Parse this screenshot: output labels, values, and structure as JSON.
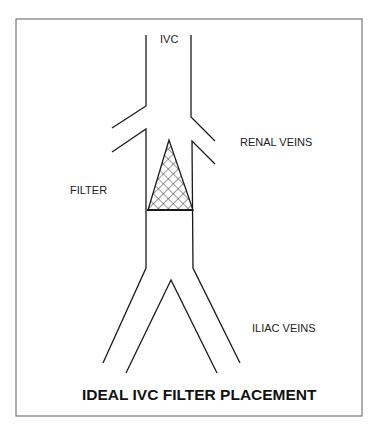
{
  "diagram": {
    "title": "IDEAL IVC FILTER PLACEMENT",
    "labels": {
      "ivc": "IVC",
      "renal_veins": "RENAL VEINS",
      "filter": "FILTER",
      "iliac_veins": "ILIAC VEINS"
    },
    "colors": {
      "line": "#1a1a1a",
      "frame": "#777777",
      "background": "#ffffff"
    }
  }
}
